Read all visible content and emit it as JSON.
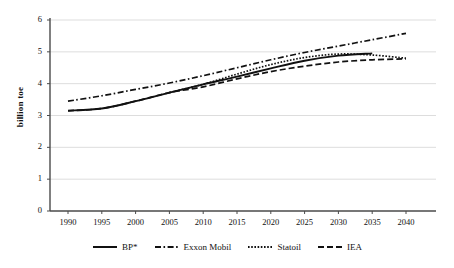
{
  "chart_data": {
    "type": "line",
    "title": "",
    "xlabel": "",
    "ylabel": "billion toe",
    "xlim": [
      1988,
      2042
    ],
    "ylim": [
      0,
      6
    ],
    "grid": true,
    "legend_position": "bottom",
    "x_ticks": [
      "1990",
      "1995",
      "2000",
      "2005",
      "2010",
      "2015",
      "2020",
      "2025",
      "2030",
      "2035",
      "2040"
    ],
    "y_ticks": [
      "0",
      "1",
      "2",
      "3",
      "4",
      "5",
      "6"
    ],
    "series": [
      {
        "name": "BP*",
        "style": "solid",
        "color": "#111111",
        "x": [
          1990,
          1995,
          2000,
          2005,
          2010,
          2015,
          2020,
          2025,
          2030,
          2035
        ],
        "values": [
          3.15,
          3.22,
          3.45,
          3.72,
          3.98,
          4.22,
          4.48,
          4.72,
          4.88,
          4.95
        ]
      },
      {
        "name": "Exxon Mobil",
        "style": "dash-dot",
        "color": "#111111",
        "x": [
          1990,
          1995,
          2000,
          2005,
          2010,
          2015,
          2020,
          2025,
          2030,
          2035,
          2040
        ],
        "values": [
          3.45,
          3.62,
          3.82,
          4.02,
          4.25,
          4.5,
          4.75,
          4.98,
          5.18,
          5.38,
          5.58
        ]
      },
      {
        "name": "Statoil",
        "style": "dotted",
        "color": "#111111",
        "x": [
          2005,
          2010,
          2015,
          2020,
          2025,
          2030,
          2035,
          2040
        ],
        "values": [
          3.72,
          3.98,
          4.3,
          4.6,
          4.82,
          4.93,
          4.9,
          4.8
        ]
      },
      {
        "name": "IEA",
        "style": "dashed",
        "color": "#111111",
        "x": [
          1990,
          1995,
          2000,
          2005,
          2010,
          2015,
          2020,
          2025,
          2030,
          2035,
          2040
        ],
        "values": [
          3.15,
          3.22,
          3.45,
          3.72,
          3.9,
          4.15,
          4.38,
          4.55,
          4.68,
          4.75,
          4.78
        ]
      }
    ]
  },
  "legend": {
    "items": [
      {
        "label": "BP*",
        "style": "solid"
      },
      {
        "label": "Exxon Mobil",
        "style": "dash-dot"
      },
      {
        "label": "Statoil",
        "style": "dotted"
      },
      {
        "label": "IEA",
        "style": "dashed"
      }
    ]
  },
  "axis": {
    "y_title": "billion toe"
  }
}
